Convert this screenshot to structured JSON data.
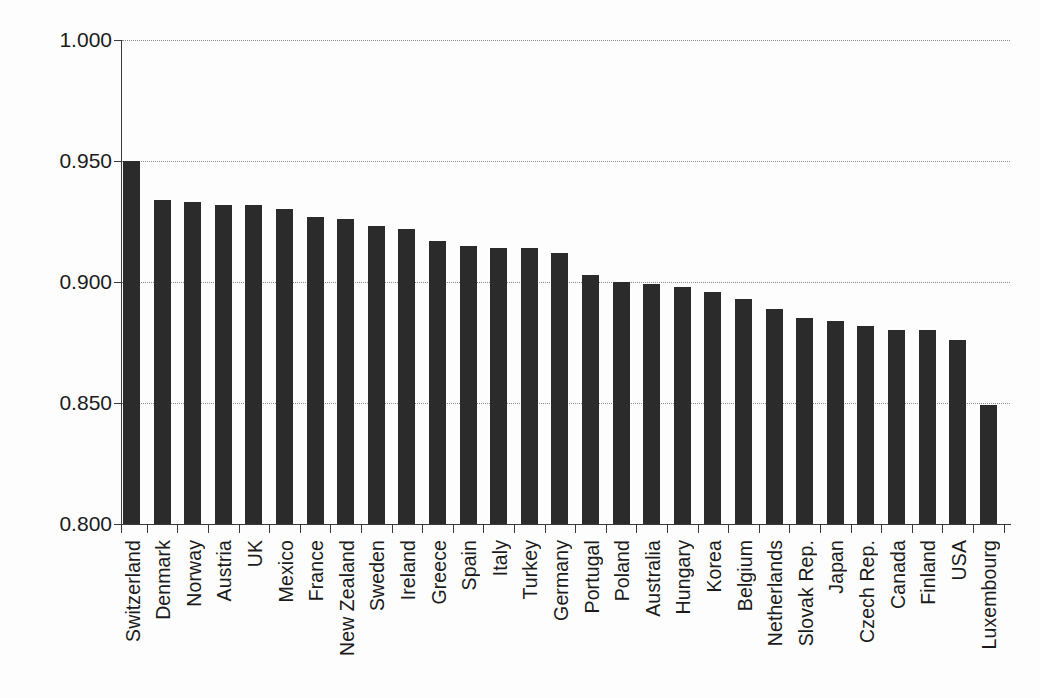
{
  "chart_data": {
    "type": "bar",
    "title": "",
    "subtitle": "",
    "xlabel": "",
    "ylabel": "",
    "ylim": [
      0.8,
      1.0
    ],
    "yticks": [
      "0.800",
      "0.850",
      "0.900",
      "0.950",
      "1.000"
    ],
    "ytick_values": [
      0.8,
      0.85,
      0.9,
      0.95,
      1.0
    ],
    "grid": "horizontal-dotted",
    "legend": "none",
    "bar_color": "#2b2b2b",
    "axis_color": "#3a3a3a",
    "grid_color": "#8a8a8a",
    "background": "#fdfdfd",
    "categories": [
      "Switzerland",
      "Denmark",
      "Norway",
      "Austria",
      "UK",
      "Mexico",
      "France",
      "New Zealand",
      "Sweden",
      "Ireland",
      "Greece",
      "Spain",
      "Italy",
      "Turkey",
      "Germany",
      "Portugal",
      "Poland",
      "Australia",
      "Hungary",
      "Korea",
      "Belgium",
      "Netherlands",
      "Slovak Rep.",
      "Japan",
      "Czech Rep.",
      "Canada",
      "Finland",
      "USA",
      "Luxembourg"
    ],
    "values": [
      0.95,
      0.934,
      0.933,
      0.932,
      0.932,
      0.93,
      0.927,
      0.926,
      0.923,
      0.922,
      0.917,
      0.915,
      0.914,
      0.914,
      0.912,
      0.903,
      0.9,
      0.899,
      0.898,
      0.896,
      0.893,
      0.889,
      0.885,
      0.884,
      0.882,
      0.88,
      0.88,
      0.876,
      0.849
    ]
  }
}
